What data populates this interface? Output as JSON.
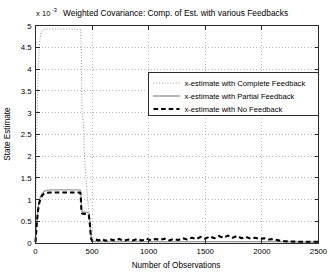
{
  "chart_data": {
    "type": "line",
    "title": "Weighted Covariance: Comp. of Est. with various Feedbacks",
    "exponent_prefix": "x 10",
    "exponent_power": "-3",
    "xlabel": "Number of Observations",
    "ylabel": "State Estimate",
    "xlim": [
      0,
      2500
    ],
    "ylim": [
      0,
      5
    ],
    "xticks": [
      0,
      500,
      1000,
      1500,
      2000,
      2500
    ],
    "xtick_labels": [
      "0",
      "500",
      "1000",
      "1500",
      "2000",
      "2500"
    ],
    "yticks": [
      0,
      0.5,
      1,
      1.5,
      2,
      2.5,
      3,
      3.5,
      4,
      4.5,
      5
    ],
    "ytick_labels": [
      "0",
      "0.5",
      "1",
      "1.5",
      "2",
      "2.5",
      "3",
      "3.5",
      "4",
      "4.5",
      "5"
    ],
    "grid": true,
    "grid_style": "dotted",
    "legend_position": "upper-right-inside",
    "y_scale_note": "values expressed in units of 1e-3",
    "series": [
      {
        "name": "x-estimate with Complete Feedback",
        "style": "dotted",
        "color": "#8c8c8c",
        "points": [
          [
            0,
            0.05
          ],
          [
            6,
            1.3
          ],
          [
            12,
            2.45
          ],
          [
            18,
            3.35
          ],
          [
            25,
            4.0
          ],
          [
            32,
            4.45
          ],
          [
            40,
            4.7
          ],
          [
            50,
            4.84
          ],
          [
            62,
            4.9
          ],
          [
            80,
            4.92
          ],
          [
            110,
            4.92
          ],
          [
            150,
            4.92
          ],
          [
            200,
            4.92
          ],
          [
            250,
            4.92
          ],
          [
            300,
            4.92
          ],
          [
            340,
            4.92
          ],
          [
            370,
            4.91
          ],
          [
            395,
            4.9
          ],
          [
            400,
            4.88
          ],
          [
            405,
            4.3
          ],
          [
            408,
            3.55
          ],
          [
            412,
            3.0
          ],
          [
            416,
            2.95
          ],
          [
            420,
            2.88
          ],
          [
            425,
            2.6
          ],
          [
            430,
            2.2
          ],
          [
            440,
            1.7
          ],
          [
            455,
            1.2
          ],
          [
            470,
            0.75
          ],
          [
            482,
            0.38
          ],
          [
            492,
            0.12
          ],
          [
            500,
            0.04
          ],
          [
            520,
            0.03
          ],
          [
            600,
            0.03
          ],
          [
            800,
            0.03
          ],
          [
            1000,
            0.03
          ],
          [
            1400,
            0.03
          ],
          [
            1800,
            0.03
          ],
          [
            2150,
            0.03
          ],
          [
            2300,
            0.02
          ],
          [
            2500,
            0.02
          ]
        ]
      },
      {
        "name": "x-estimate with Partial Feedback",
        "style": "solid",
        "color": "#9d9d9d",
        "points": [
          [
            0,
            0.03
          ],
          [
            8,
            0.35
          ],
          [
            16,
            0.62
          ],
          [
            24,
            0.82
          ],
          [
            34,
            0.97
          ],
          [
            46,
            1.08
          ],
          [
            60,
            1.15
          ],
          [
            78,
            1.19
          ],
          [
            100,
            1.21
          ],
          [
            130,
            1.22
          ],
          [
            180,
            1.22
          ],
          [
            240,
            1.22
          ],
          [
            300,
            1.22
          ],
          [
            350,
            1.22
          ],
          [
            385,
            1.22
          ],
          [
            398,
            1.21
          ],
          [
            402,
            1.05
          ],
          [
            406,
            0.8
          ],
          [
            412,
            0.72
          ],
          [
            425,
            0.71
          ],
          [
            445,
            0.71
          ],
          [
            462,
            0.7
          ],
          [
            472,
            0.68
          ],
          [
            480,
            0.5
          ],
          [
            487,
            0.26
          ],
          [
            493,
            0.1
          ],
          [
            500,
            0.04
          ],
          [
            540,
            0.03
          ],
          [
            700,
            0.03
          ],
          [
            1000,
            0.03
          ],
          [
            1500,
            0.03
          ],
          [
            2000,
            0.03
          ],
          [
            2150,
            0.03
          ],
          [
            2500,
            0.02
          ]
        ]
      },
      {
        "name": "x-estimate with No Feedback",
        "style": "dashed",
        "color": "#000000",
        "points": [
          [
            0,
            0.02
          ],
          [
            7,
            0.3
          ],
          [
            15,
            0.56
          ],
          [
            23,
            0.76
          ],
          [
            33,
            0.92
          ],
          [
            45,
            1.02
          ],
          [
            58,
            1.09
          ],
          [
            75,
            1.13
          ],
          [
            98,
            1.15
          ],
          [
            128,
            1.16
          ],
          [
            175,
            1.16
          ],
          [
            235,
            1.16
          ],
          [
            300,
            1.16
          ],
          [
            350,
            1.16
          ],
          [
            385,
            1.16
          ],
          [
            397,
            1.15
          ],
          [
            401,
            1.0
          ],
          [
            405,
            0.76
          ],
          [
            411,
            0.68
          ],
          [
            424,
            0.67
          ],
          [
            444,
            0.67
          ],
          [
            461,
            0.66
          ],
          [
            471,
            0.64
          ],
          [
            479,
            0.47
          ],
          [
            486,
            0.24
          ],
          [
            492,
            0.09
          ],
          [
            500,
            0.05
          ],
          [
            530,
            0.08
          ],
          [
            560,
            0.06
          ],
          [
            590,
            0.09
          ],
          [
            620,
            0.05
          ],
          [
            660,
            0.08
          ],
          [
            700,
            0.06
          ],
          [
            740,
            0.09
          ],
          [
            780,
            0.05
          ],
          [
            820,
            0.08
          ],
          [
            860,
            0.06
          ],
          [
            900,
            0.09
          ],
          [
            940,
            0.06
          ],
          [
            980,
            0.1
          ],
          [
            1020,
            0.06
          ],
          [
            1060,
            0.09
          ],
          [
            1100,
            0.07
          ],
          [
            1140,
            0.1
          ],
          [
            1180,
            0.06
          ],
          [
            1220,
            0.09
          ],
          [
            1260,
            0.07
          ],
          [
            1300,
            0.11
          ],
          [
            1340,
            0.08
          ],
          [
            1380,
            0.12
          ],
          [
            1420,
            0.09
          ],
          [
            1460,
            0.14
          ],
          [
            1500,
            0.1
          ],
          [
            1540,
            0.15
          ],
          [
            1580,
            0.11
          ],
          [
            1620,
            0.16
          ],
          [
            1660,
            0.12
          ],
          [
            1700,
            0.17
          ],
          [
            1740,
            0.12
          ],
          [
            1780,
            0.16
          ],
          [
            1820,
            0.11
          ],
          [
            1860,
            0.14
          ],
          [
            1900,
            0.1
          ],
          [
            1940,
            0.12
          ],
          [
            1980,
            0.09
          ],
          [
            2020,
            0.11
          ],
          [
            2060,
            0.08
          ],
          [
            2100,
            0.09
          ],
          [
            2150,
            0.06
          ],
          [
            2200,
            0.04
          ],
          [
            2300,
            0.03
          ],
          [
            2400,
            0.03
          ],
          [
            2500,
            0.03
          ]
        ]
      }
    ]
  }
}
